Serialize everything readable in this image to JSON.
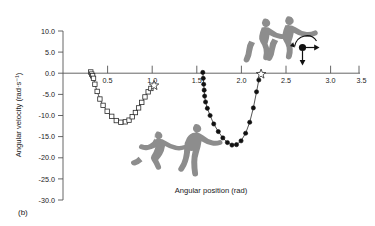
{
  "panel": {
    "label": "(b)"
  },
  "chart_data": {
    "type": "line",
    "title": "",
    "xlabel": "Angular position (rad)",
    "ylabel": "Angular velocity (rad·s⁻¹)",
    "xlim": [
      0.25,
      3.5
    ],
    "ylim": [
      -30.0,
      10.0
    ],
    "grid": false,
    "legend": "none",
    "xticks": [
      0.5,
      1.0,
      1.5,
      2.0,
      2.5,
      3.0,
      3.5
    ],
    "xtick_labels": [
      "0.5",
      "1.0",
      "1.5",
      "2.0",
      "2.5",
      "3.0",
      "3.5"
    ],
    "yticks": [
      10.0,
      5.0,
      0.0,
      -5.0,
      -10.0,
      -15.0,
      -20.0,
      -25.0,
      -30.0
    ],
    "ytick_labels": [
      "10.0",
      "5.0",
      "0.0",
      "-5.0",
      "-10.0",
      "-15.0",
      "-20.0",
      "-25.0",
      "-30.0"
    ],
    "series": [
      {
        "name": "first-movement-open-squares",
        "marker": "open-square",
        "x": [
          0.555,
          0.565,
          0.575,
          0.585,
          0.6,
          0.625,
          0.655,
          0.69,
          0.735,
          0.785,
          0.835,
          0.885,
          0.935,
          0.975,
          1.01,
          1.045,
          1.08,
          1.115,
          1.15,
          1.185,
          1.215
        ],
        "y": [
          0.3,
          -0.2,
          -0.6,
          -1.2,
          -2.6,
          -4.3,
          -6.1,
          -7.6,
          -9.0,
          -10.2,
          -11.2,
          -11.6,
          -11.5,
          -11.1,
          -10.3,
          -9.3,
          -8.2,
          -6.9,
          -5.6,
          -4.4,
          -3.6
        ]
      },
      {
        "name": "first-movement-endpoint-star",
        "marker": "open-star",
        "x": [
          1.25
        ],
        "y": [
          -2.9
        ]
      },
      {
        "name": "second-movement-filled-circles",
        "marker": "filled-circle",
        "x": [
          1.785,
          1.79,
          1.795,
          1.8,
          1.805,
          1.815,
          1.835,
          1.865,
          1.905,
          1.955,
          2.005,
          2.055,
          2.105,
          2.155,
          2.205,
          2.255,
          2.3,
          2.34,
          2.375,
          2.4
        ],
        "y": [
          0.2,
          -1.2,
          -2.6,
          -4.0,
          -5.4,
          -6.8,
          -8.3,
          -10.0,
          -12.0,
          -13.8,
          -15.3,
          -16.4,
          -17.0,
          -16.9,
          -16.0,
          -14.2,
          -11.6,
          -8.2,
          -4.4,
          -1.6
        ]
      },
      {
        "name": "second-movement-endpoint-star",
        "marker": "open-star",
        "x": [
          2.425
        ],
        "y": [
          -0.2
        ]
      }
    ],
    "annotations": [
      {
        "name": "figure-crouch-lower-left",
        "type": "human-silhouette",
        "x": 1.12,
        "y": -19.5
      },
      {
        "name": "figure-bend-lower-right",
        "type": "human-silhouette",
        "x": 1.38,
        "y": -19.0
      },
      {
        "name": "figure-jump-upper-left",
        "type": "human-silhouette",
        "x": 2.02,
        "y": 7.5
      },
      {
        "name": "figure-jump-upper-right",
        "type": "human-silhouette",
        "x": 2.21,
        "y": 7.8
      },
      {
        "name": "center-of-mass-rotation-icon",
        "type": "diagram",
        "x": 2.52,
        "y": 3.6
      }
    ]
  }
}
